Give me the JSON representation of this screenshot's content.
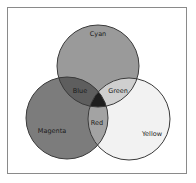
{
  "diagram": {
    "type": "venn",
    "sets": [
      {
        "name": "Cyan",
        "label": "Cyan",
        "cx": 98,
        "cy": 66,
        "r": 41,
        "fill": "#9a9a9a"
      },
      {
        "name": "Magenta",
        "label": "Magenta",
        "cx": 67,
        "cy": 118,
        "r": 41,
        "fill": "#7c7c7c"
      },
      {
        "name": "Yellow",
        "label": "Yellow",
        "cx": 129,
        "cy": 119,
        "r": 41,
        "fill": "#f2f2f2"
      }
    ],
    "intersections": [
      {
        "sets": [
          "Cyan",
          "Magenta"
        ],
        "label": "Blue",
        "fill": "#5e5e5e"
      },
      {
        "sets": [
          "Cyan",
          "Yellow"
        ],
        "label": "Green",
        "fill": "#cfcfcf"
      },
      {
        "sets": [
          "Magenta",
          "Yellow"
        ],
        "label": "Red",
        "fill": "#a3a3a3"
      },
      {
        "sets": [
          "Cyan",
          "Magenta",
          "Yellow"
        ],
        "label": "",
        "fill": "#1e1e1e"
      }
    ],
    "labels": {
      "cyan": "Cyan",
      "magenta": "Magenta",
      "yellow": "Yellow",
      "blue": "Blue",
      "green": "Green",
      "red": "Red"
    },
    "stroke_color": "#3a3a3a",
    "frame_color": "#8a8a8a"
  }
}
